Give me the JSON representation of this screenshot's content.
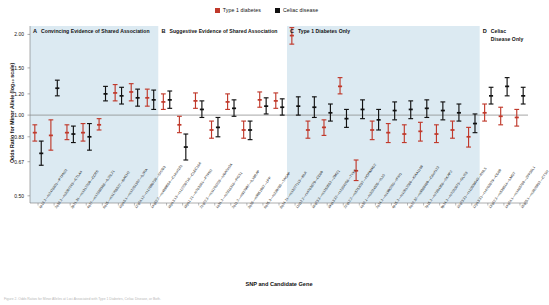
{
  "figure": {
    "ytitle": "Odds Ratio for Minor Allele (log₁₀ scale)",
    "xtitle": "SNP and Candidate Gene",
    "caption": "Figure 2. Odds Ratios for Minor Alleles at Loci Associated with Type 1 Diabetes, Celiac Disease, or Both."
  },
  "legend": {
    "position": "top-center",
    "items": [
      {
        "label": "Type 1 diabetes",
        "color": "#c0392b",
        "swatch": "square-marker"
      },
      {
        "label": "Celiac disease",
        "color": "#111111",
        "swatch": "square-marker"
      }
    ]
  },
  "panels": [
    {
      "letter": "A",
      "title": "Convincing Evidence of Shared Association",
      "shaded": true
    },
    {
      "letter": "B",
      "title": "Suggestive Evidence of Shared Association",
      "shaded": false
    },
    {
      "letter": "C",
      "title": "Type 1 Diabetes Only",
      "shaded": true
    },
    {
      "letter": "D",
      "title": "Celiac Disease Only",
      "shaded": false
    }
  ],
  "chart_data": {
    "type": "scatter",
    "title": "",
    "subtitle": "",
    "xlabel": "SNP and Candidate Gene",
    "ylabel": "Odds Ratio for Minor Allele (log₁₀ scale)",
    "yscale": "log",
    "ylim": [
      0.47,
      2.15
    ],
    "yticks": [
      2.0,
      1.5,
      1.2,
      1.0,
      0.83,
      0.67,
      0.5
    ],
    "ytick_labels": [
      "2.00",
      "1.50",
      "1.20",
      "1.00",
      "0.83",
      "0.67",
      "0.50"
    ],
    "reference_line": 1.0,
    "grid": false,
    "legend_position": "top-center",
    "series": [
      {
        "name": "Type 1 diabetes",
        "color": "#c0392b"
      },
      {
        "name": "Celiac disease",
        "color": "#111111"
      }
    ],
    "categories": [
      "1p13.2—rs2476601—PTPN22",
      "2q33.2—rs3087243—CTLA4",
      "3p21.31—rs1317209—CCR5",
      "4q27—rs17388568—IL2/IL21",
      "6q15—rs11755527—BACH2",
      "10p15.1—rs12251307—IL2RA",
      "12q24.12—rs17696736—SH2B3",
      "14q32.2—rs4899554—C14orf181",
      "16p13.13—rs12708716—CLEC16A",
      "18p11.21—rs763361—PTPN2",
      "21q22.3—rs11203203—UBASH3A",
      "1q31.2—rs2816316—RGS1",
      "2q11.2—rs917997—IL18RAP",
      "3q28—rs9851967—LPP",
      "6q25.3—rs339788—TAGAP",
      "8q24.21—rs13277113—BLK",
      "11q12.2—rs4763879—CD69",
      "16q23.3—rs1250552—ZMIZ1",
      "19q13.32—rs2304256—TYK2",
      "22q12.2—rs5753037—HORMAD2",
      "1q32.1—rs3024505—IL10",
      "2q24.2—rs1990760—IFIH1",
      "4p15.2—rs10517086—KIAA1109",
      "6q22.32—rs9388489—C6orf173",
      "7p15.2—rs7804356—SKAP2",
      "9p24.2—rs7020673—GLIS3",
      "10q23.31—rs10509540—RNLS",
      "12p13.31—rs4763879—CD69",
      "13q32.3—rs539514—LMO7",
      "14q24.1—rs1465788—ZFP36L1",
      "15q25.1—rs3825932—CTSH",
      "16p11.2—rs4788084—IL27",
      "17q12—rs2290400—ORMDL3",
      "20p13—rs2281808—SIRPG",
      "22q13.1—rs229541—C1QTNF6",
      "2q12.1—rs13010713—ITGA4",
      "3q25.33—rs13098911—CCR4",
      "6q23.3—rs10499194—TNFAIP3"
    ],
    "points": [
      {
        "i": 0,
        "panel": "A",
        "t1d": {
          "or": 0.86,
          "lo": 0.8,
          "hi": 0.92
        },
        "celiac": {
          "or": 0.72,
          "lo": 0.65,
          "hi": 0.8
        }
      },
      {
        "i": 1,
        "panel": "A",
        "t1d": {
          "or": 0.84,
          "lo": 0.74,
          "hi": 0.96
        },
        "celiac": {
          "or": 1.26,
          "lo": 1.18,
          "hi": 1.35
        }
      },
      {
        "i": 2,
        "panel": "A",
        "t1d": {
          "or": 0.86,
          "lo": 0.81,
          "hi": 0.92
        },
        "celiac": {
          "or": 0.85,
          "lo": 0.79,
          "hi": 0.91
        }
      },
      {
        "i": 3,
        "panel": "A",
        "t1d": {
          "or": 0.86,
          "lo": 0.8,
          "hi": 0.93
        },
        "celiac": {
          "or": 0.83,
          "lo": 0.74,
          "hi": 0.93
        }
      },
      {
        "i": 4,
        "panel": "A",
        "t1d": {
          "or": 0.92,
          "lo": 0.88,
          "hi": 0.97
        },
        "celiac": {
          "or": 1.2,
          "lo": 1.13,
          "hi": 1.28
        }
      },
      {
        "i": 5,
        "panel": "A",
        "t1d": {
          "or": 1.21,
          "lo": 1.13,
          "hi": 1.3
        },
        "celiac": {
          "or": 1.18,
          "lo": 1.1,
          "hi": 1.27
        }
      },
      {
        "i": 6,
        "panel": "A",
        "t1d": {
          "or": 1.22,
          "lo": 1.13,
          "hi": 1.31
        },
        "celiac": {
          "or": 1.16,
          "lo": 1.08,
          "hi": 1.25
        }
      },
      {
        "i": 7,
        "panel": "A",
        "t1d": {
          "or": 1.16,
          "lo": 1.08,
          "hi": 1.25
        },
        "celiac": {
          "or": 1.14,
          "lo": 1.05,
          "hi": 1.24
        }
      },
      {
        "i": 8,
        "panel": "B",
        "t1d": {
          "or": 1.12,
          "lo": 1.05,
          "hi": 1.2
        },
        "celiac": {
          "or": 1.14,
          "lo": 1.06,
          "hi": 1.23
        }
      },
      {
        "i": 9,
        "panel": "B",
        "t1d": {
          "or": 0.92,
          "lo": 0.86,
          "hi": 0.99
        },
        "celiac": {
          "or": 0.76,
          "lo": 0.68,
          "hi": 0.85
        }
      },
      {
        "i": 10,
        "panel": "B",
        "t1d": {
          "or": 1.13,
          "lo": 1.06,
          "hi": 1.21
        },
        "celiac": {
          "or": 1.05,
          "lo": 0.98,
          "hi": 1.13
        }
      },
      {
        "i": 11,
        "panel": "B",
        "t1d": {
          "or": 0.88,
          "lo": 0.82,
          "hi": 0.95
        },
        "celiac": {
          "or": 0.9,
          "lo": 0.83,
          "hi": 0.98
        }
      },
      {
        "i": 12,
        "panel": "B",
        "t1d": {
          "or": 1.12,
          "lo": 1.05,
          "hi": 1.2
        },
        "celiac": {
          "or": 1.06,
          "lo": 0.99,
          "hi": 1.14
        }
      },
      {
        "i": 13,
        "panel": "B",
        "t1d": {
          "or": 0.88,
          "lo": 0.82,
          "hi": 0.95
        },
        "celiac": {
          "or": 0.88,
          "lo": 0.81,
          "hi": 0.95
        }
      },
      {
        "i": 14,
        "panel": "B",
        "t1d": {
          "or": 1.14,
          "lo": 1.07,
          "hi": 1.22
        },
        "celiac": {
          "or": 1.08,
          "lo": 1.01,
          "hi": 1.16
        }
      },
      {
        "i": 15,
        "panel": "B",
        "t1d": {
          "or": 1.13,
          "lo": 1.06,
          "hi": 1.21
        },
        "celiac": {
          "or": 1.07,
          "lo": 1.0,
          "hi": 1.15
        }
      },
      {
        "i": 16,
        "panel": "C",
        "t1d": {
          "or": 1.98,
          "lo": 1.84,
          "hi": 2.12
        },
        "celiac": {
          "or": 1.08,
          "lo": 1.0,
          "hi": 1.17
        }
      },
      {
        "i": 17,
        "panel": "C",
        "t1d": {
          "or": 0.88,
          "lo": 0.82,
          "hi": 0.95
        },
        "celiac": {
          "or": 1.07,
          "lo": 0.98,
          "hi": 1.17
        }
      },
      {
        "i": 18,
        "panel": "C",
        "t1d": {
          "or": 0.9,
          "lo": 0.84,
          "hi": 0.96
        },
        "celiac": {
          "or": 1.02,
          "lo": 0.95,
          "hi": 1.1
        }
      },
      {
        "i": 19,
        "panel": "C",
        "t1d": {
          "or": 1.28,
          "lo": 1.2,
          "hi": 1.38
        },
        "celiac": {
          "or": 0.97,
          "lo": 0.9,
          "hi": 1.05
        }
      },
      {
        "i": 20,
        "panel": "C",
        "t1d": {
          "or": 0.62,
          "lo": 0.57,
          "hi": 0.68
        },
        "celiac": {
          "or": 1.05,
          "lo": 0.97,
          "hi": 1.14
        }
      },
      {
        "i": 21,
        "panel": "C",
        "t1d": {
          "or": 0.88,
          "lo": 0.81,
          "hi": 0.95
        },
        "celiac": {
          "or": 0.96,
          "lo": 0.88,
          "hi": 1.05
        }
      },
      {
        "i": 22,
        "panel": "C",
        "t1d": {
          "or": 0.86,
          "lo": 0.79,
          "hi": 0.93
        },
        "celiac": {
          "or": 1.04,
          "lo": 0.96,
          "hi": 1.12
        }
      },
      {
        "i": 23,
        "panel": "C",
        "t1d": {
          "or": 0.85,
          "lo": 0.79,
          "hi": 0.92
        },
        "celiac": {
          "or": 1.05,
          "lo": 0.97,
          "hi": 1.13
        }
      },
      {
        "i": 24,
        "panel": "C",
        "t1d": {
          "or": 0.87,
          "lo": 0.8,
          "hi": 0.94
        },
        "celiac": {
          "or": 1.06,
          "lo": 0.98,
          "hi": 1.14
        }
      },
      {
        "i": 25,
        "panel": "C",
        "t1d": {
          "or": 0.85,
          "lo": 0.79,
          "hi": 0.92
        },
        "celiac": {
          "or": 1.04,
          "lo": 0.96,
          "hi": 1.12
        }
      },
      {
        "i": 26,
        "panel": "C",
        "t1d": {
          "or": 0.88,
          "lo": 0.82,
          "hi": 0.95
        },
        "celiac": {
          "or": 1.02,
          "lo": 0.95,
          "hi": 1.1
        }
      },
      {
        "i": 27,
        "panel": "C",
        "t1d": {
          "or": 0.83,
          "lo": 0.76,
          "hi": 0.9
        },
        "celiac": {
          "or": 0.93,
          "lo": 0.86,
          "hi": 1.01
        }
      },
      {
        "i": 28,
        "panel": "D",
        "t1d": {
          "or": 1.02,
          "lo": 0.95,
          "hi": 1.1
        },
        "celiac": {
          "or": 1.18,
          "lo": 1.1,
          "hi": 1.27
        }
      },
      {
        "i": 29,
        "panel": "D",
        "t1d": {
          "or": 0.99,
          "lo": 0.92,
          "hi": 1.07
        },
        "celiac": {
          "or": 1.28,
          "lo": 1.18,
          "hi": 1.38
        }
      },
      {
        "i": 30,
        "panel": "D",
        "t1d": {
          "or": 0.98,
          "lo": 0.91,
          "hi": 1.05
        },
        "celiac": {
          "or": 1.18,
          "lo": 1.1,
          "hi": 1.27
        }
      }
    ]
  }
}
